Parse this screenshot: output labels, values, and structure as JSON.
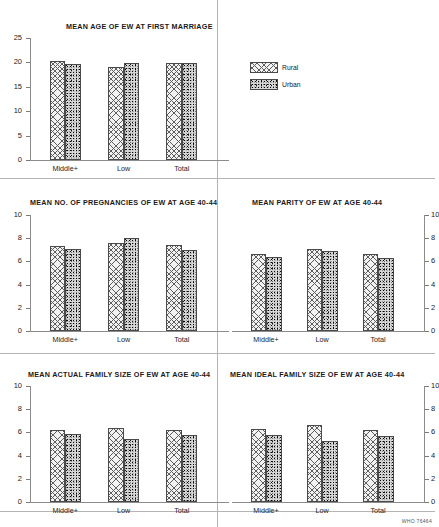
{
  "figure": {
    "credit": "WHO 76464",
    "legend": {
      "position": "top-center-right",
      "entries": [
        {
          "label": "Rural",
          "pattern": "cross-hatch",
          "color": "#f2f2f2"
        },
        {
          "label": "Urban",
          "pattern": "dense-speckle",
          "color": "#d8d8d8"
        }
      ]
    }
  },
  "chart_data": [
    {
      "id": "mean-age-first-marriage",
      "type": "bar",
      "title": "MEAN AGE OF EW AT FIRST MARRIAGE",
      "xlabel": "",
      "ylabel": "",
      "ylim": [
        0,
        25
      ],
      "yticks": [
        0,
        5,
        10,
        15,
        20,
        25
      ],
      "ytick_labels": [
        "0",
        "5",
        "10",
        "15",
        "20",
        "25"
      ],
      "axis_side": "left",
      "grid": false,
      "categories": [
        "Middle+",
        "Low",
        "Total"
      ],
      "series": [
        {
          "name": "Rural",
          "values": [
            20.2,
            19.1,
            19.8
          ]
        },
        {
          "name": "Urban",
          "values": [
            19.7,
            19.8,
            19.8
          ]
        }
      ]
    },
    {
      "id": "mean-no-pregnancies",
      "type": "bar",
      "title": "MEAN NO. OF PREGNANCIES OF EW AT AGE 40-44",
      "xlabel": "",
      "ylabel": "",
      "ylim": [
        0,
        10
      ],
      "yticks": [
        0,
        2,
        4,
        6,
        8,
        10
      ],
      "ytick_labels": [
        "0",
        "2",
        "4",
        "6",
        "8",
        "10"
      ],
      "axis_side": "left",
      "grid": false,
      "categories": [
        "Middle+",
        "Low",
        "Total"
      ],
      "series": [
        {
          "name": "Rural",
          "values": [
            7.3,
            7.6,
            7.4
          ]
        },
        {
          "name": "Urban",
          "values": [
            7.1,
            8.0,
            7.0
          ]
        }
      ]
    },
    {
      "id": "mean-parity",
      "type": "bar",
      "title": "MEAN PARITY OF EW AT AGE 40-44",
      "xlabel": "",
      "ylabel": "",
      "ylim": [
        0,
        10
      ],
      "yticks": [
        0,
        2,
        4,
        6,
        8,
        10
      ],
      "ytick_labels": [
        "0",
        "2",
        "4",
        "6",
        "8",
        "10"
      ],
      "axis_side": "right",
      "grid": false,
      "categories": [
        "Middle+",
        "Low",
        "Total"
      ],
      "series": [
        {
          "name": "Rural",
          "values": [
            6.6,
            7.1,
            6.6
          ]
        },
        {
          "name": "Urban",
          "values": [
            6.4,
            6.9,
            6.3
          ]
        }
      ]
    },
    {
      "id": "mean-actual-family-size",
      "type": "bar",
      "title": "MEAN ACTUAL FAMILY SIZE OF EW AT AGE 40-44",
      "xlabel": "",
      "ylabel": "",
      "ylim": [
        0,
        10
      ],
      "yticks": [
        0,
        2,
        4,
        6,
        8,
        10
      ],
      "ytick_labels": [
        "0",
        "2",
        "4",
        "6",
        "8",
        "10"
      ],
      "axis_side": "left",
      "grid": false,
      "categories": [
        "Middle+",
        "Low",
        "Total"
      ],
      "series": [
        {
          "name": "Rural",
          "values": [
            6.2,
            6.35,
            6.2
          ]
        },
        {
          "name": "Urban",
          "values": [
            5.9,
            5.4,
            5.75
          ]
        }
      ]
    },
    {
      "id": "mean-ideal-family-size",
      "type": "bar",
      "title": "MEAN IDEAL FAMILY SIZE OF EW AT AGE 40-44",
      "xlabel": "",
      "ylabel": "",
      "ylim": [
        0,
        10
      ],
      "yticks": [
        0,
        2,
        4,
        6,
        8,
        10
      ],
      "ytick_labels": [
        "0",
        "2",
        "4",
        "6",
        "8",
        "10"
      ],
      "axis_side": "right",
      "grid": false,
      "categories": [
        "Middle+",
        "Low",
        "Total"
      ],
      "series": [
        {
          "name": "Rural",
          "values": [
            6.3,
            6.6,
            6.2
          ]
        },
        {
          "name": "Urban",
          "values": [
            5.8,
            5.3,
            5.7
          ]
        }
      ]
    }
  ]
}
